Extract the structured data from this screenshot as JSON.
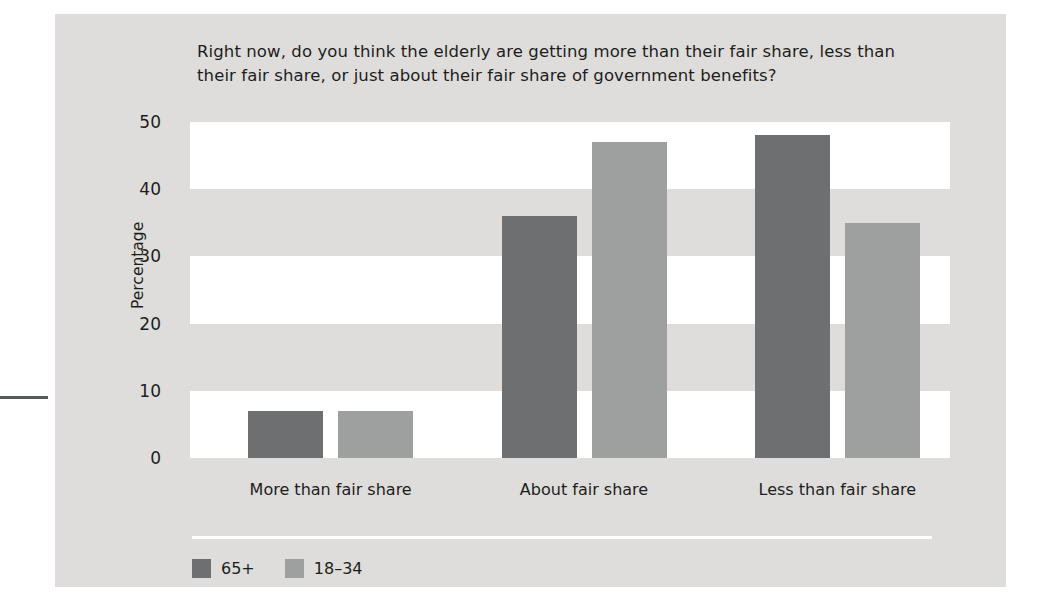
{
  "chart_data": {
    "type": "bar",
    "title": "Right now, do you think the elderly are getting more than their fair share, less than their fair share, or just about their fair share of government benefits?",
    "categories": [
      "More than fair share",
      "About fair share",
      "Less than fair share"
    ],
    "series": [
      {
        "name": "65+",
        "color": "#6d6f70",
        "values": [
          7,
          36,
          48
        ]
      },
      {
        "name": "18–34",
        "color": "#9ea0a0",
        "values": [
          7,
          47,
          35
        ]
      }
    ],
    "xlabel": "",
    "ylabel": "Percentage",
    "ylim": [
      0,
      50
    ],
    "yticks": [
      0,
      10,
      20,
      30,
      40,
      50
    ],
    "ytick_labels": [
      "0",
      "10",
      "20",
      "30",
      "40",
      "50"
    ],
    "grid": "alternating-horizontal-bands",
    "legend_position": "bottom-left",
    "background_color": "#dedddb",
    "band_color": "#ffffff"
  },
  "panel": {
    "title": "Right now, do you think the elderly are getting more than their fair share, less than their fair share, or just about their fair share of government benefits?",
    "y_axis_title": "Percentage"
  }
}
